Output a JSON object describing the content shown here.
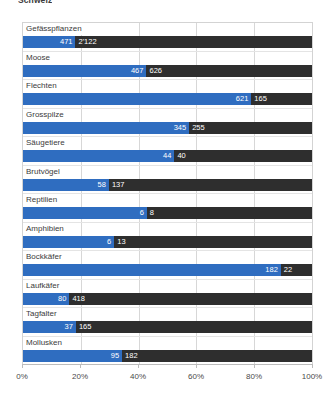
{
  "title": "Schweiz",
  "axis": {
    "ticks": [
      "0%",
      "20%",
      "40%",
      "60%",
      "80%",
      "100%"
    ],
    "tick_values": [
      0,
      20,
      40,
      60,
      80,
      100
    ]
  },
  "chart_data": {
    "type": "bar",
    "orientation": "horizontal",
    "stacked": true,
    "normalized": true,
    "title": "Schweiz",
    "xlabel": "",
    "ylabel": "",
    "xlim": [
      0,
      100
    ],
    "grid": true,
    "legend_position": "none",
    "categories": [
      "Gefässpflanzen",
      "Moose",
      "Flechten",
      "Grosspilze",
      "Säugetiere",
      "Brutvögel",
      "Reptilien",
      "Amphibien",
      "Bockkäfer",
      "Laufkäfer",
      "Tagfalter",
      "Mollusken"
    ],
    "series": [
      {
        "name": "blau",
        "color": "#2f6dc0",
        "values": [
          471,
          467,
          621,
          345,
          44,
          58,
          6,
          6,
          182,
          80,
          37,
          95
        ]
      },
      {
        "name": "dunkel",
        "color": "#2e2e2e",
        "values": [
          2122,
          626,
          165,
          255,
          40,
          137,
          8,
          13,
          22,
          418,
          165,
          182
        ]
      }
    ],
    "value_labels": [
      [
        "471",
        "2'122"
      ],
      [
        "467",
        "626"
      ],
      [
        "621",
        "165"
      ],
      [
        "345",
        "255"
      ],
      [
        "44",
        "40"
      ],
      [
        "58",
        "137"
      ],
      [
        "6",
        "8"
      ],
      [
        "6",
        "13"
      ],
      [
        "182",
        "22"
      ],
      [
        "80",
        "418"
      ],
      [
        "37",
        "165"
      ],
      [
        "95",
        "182"
      ]
    ]
  }
}
